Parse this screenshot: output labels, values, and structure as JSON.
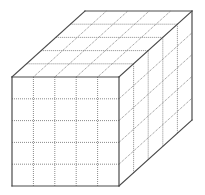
{
  "diagram": {
    "title": "",
    "divisions": {
      "width": 5,
      "height": 5,
      "depth": 5
    },
    "geometry": {
      "front_top_left": [
        12,
        77
      ],
      "front_size": [
        107,
        109
      ],
      "depth_offset": [
        73,
        -66
      ]
    },
    "colors": {
      "background": "#ffffff",
      "edge": "#4a4a4a",
      "grid": "#8a8a8a"
    },
    "faces": [
      "front",
      "top",
      "right"
    ],
    "labels": []
  }
}
